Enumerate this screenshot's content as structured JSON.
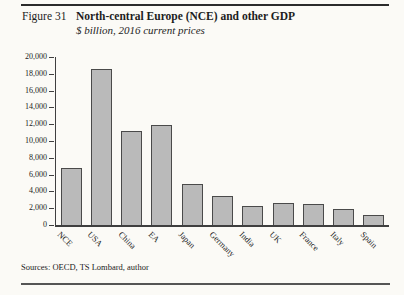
{
  "header": {
    "figure_label": "Figure 31",
    "title": "North-central Europe (NCE) and other GDP",
    "subtitle": "$ billion, 2016 current prices"
  },
  "chart_data": {
    "type": "bar",
    "title": "North-central Europe (NCE) and other GDP",
    "subtitle": "$ billion, 2016 current prices",
    "categories": [
      "NCE",
      "USA",
      "China",
      "EA",
      "Japan",
      "Germany",
      "India",
      "UK",
      "France",
      "Italy",
      "Spain"
    ],
    "values": [
      6800,
      18600,
      11200,
      11900,
      4900,
      3500,
      2260,
      2650,
      2470,
      1860,
      1240
    ],
    "xlabel": "",
    "ylabel": "",
    "ylim": [
      0,
      20000
    ],
    "ytick_step": 2000,
    "ytick_labels": [
      "0",
      "2,000",
      "4,000",
      "6,000",
      "8,000",
      "10,000",
      "12,000",
      "14,000",
      "16,000",
      "18,000",
      "20,000"
    ],
    "grid": false,
    "legend": false,
    "xlabel_rotation_deg": 45,
    "bar_fill": "#bababa",
    "bar_border": "#4a4a4a"
  },
  "footer": {
    "source": "Sources: OECD, TS Lombard, author"
  }
}
